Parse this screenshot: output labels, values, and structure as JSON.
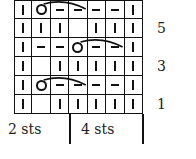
{
  "chart": {
    "rows": [
      {
        "row": 6,
        "cells": [
          "knit",
          "yo",
          "purl",
          "purl",
          "purl",
          "purl",
          "knit"
        ],
        "arc": [
          1,
          3
        ]
      },
      {
        "row": 5,
        "cells": [
          "knit",
          "knit",
          "knit",
          "empty",
          "knit",
          "knit",
          "knit"
        ]
      },
      {
        "row": 4,
        "cells": [
          "knit",
          "purl",
          "purl",
          "yo",
          "purl",
          "purl",
          "knit"
        ],
        "arc": [
          3,
          5
        ]
      },
      {
        "row": 3,
        "cells": [
          "knit",
          "empty",
          "knit",
          "knit",
          "knit",
          "knit",
          "knit"
        ]
      },
      {
        "row": 2,
        "cells": [
          "knit",
          "yo",
          "purl",
          "purl",
          "purl",
          "purl",
          "knit"
        ],
        "arc": [
          1,
          3
        ]
      },
      {
        "row": 1,
        "cells": [
          "knit",
          "empty",
          "knit",
          "knit",
          "knit",
          "knit",
          "knit"
        ]
      }
    ],
    "row_labels": {
      "r5": "5",
      "r3": "3",
      "r1": "1"
    },
    "legend": {
      "left": "2 sts",
      "right": "4 sts"
    }
  }
}
